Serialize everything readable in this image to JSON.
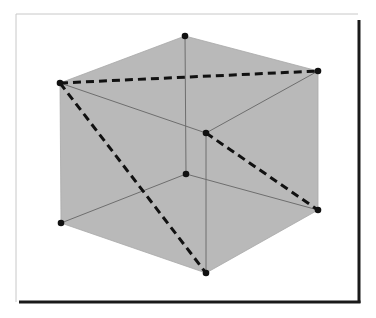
{
  "diagram": {
    "type": "cube-with-diagonals",
    "colors": {
      "background": "#ffffff",
      "face_fill": "#b9b9b9",
      "thin_edge": "#6e6e6e",
      "dashed_edge": "#111111",
      "vertex": "#111111",
      "frame_light": "#c8c8c8",
      "frame_shadow": "#1a1a1a"
    },
    "frame": {
      "x": 16,
      "y": 14,
      "width": 342,
      "height": 288
    },
    "vertices": [
      {
        "id": "top-back",
        "x": 185,
        "y": 36
      },
      {
        "id": "top-left",
        "x": 60,
        "y": 83
      },
      {
        "id": "top-right",
        "x": 318,
        "y": 71
      },
      {
        "id": "top-front",
        "x": 206,
        "y": 133
      },
      {
        "id": "bottom-back",
        "x": 186,
        "y": 174
      },
      {
        "id": "bottom-left",
        "x": 61,
        "y": 223
      },
      {
        "id": "bottom-right",
        "x": 318,
        "y": 210
      },
      {
        "id": "bottom-front",
        "x": 206,
        "y": 273
      }
    ],
    "thin_edges": [
      [
        "top-back",
        "bottom-back"
      ],
      [
        "bottom-back",
        "bottom-left"
      ],
      [
        "bottom-back",
        "bottom-right"
      ],
      [
        "top-left",
        "top-front"
      ],
      [
        "top-front",
        "top-right"
      ],
      [
        "top-front",
        "bottom-front"
      ]
    ],
    "dashed_edges": [
      [
        "top-left",
        "top-right"
      ],
      [
        "top-left",
        "bottom-front"
      ],
      [
        "top-front",
        "bottom-right"
      ]
    ]
  }
}
